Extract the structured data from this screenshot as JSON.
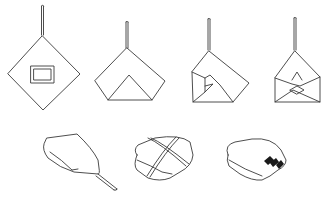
{
  "diagram": {
    "stroke_color": "#3a3a3a",
    "background": "#ffffff",
    "steps": [
      {
        "index": 1,
        "name": "object-centered-on-diamond-cloth"
      },
      {
        "index": 2,
        "name": "bottom-corner-folded-up"
      },
      {
        "index": 3,
        "name": "left-corner-folded-in"
      },
      {
        "index": 4,
        "name": "right-corner-folded-in"
      },
      {
        "index": 5,
        "name": "rolled-toward-top-corner"
      },
      {
        "index": 6,
        "name": "tied-with-string"
      },
      {
        "index": 7,
        "name": "finished-with-label-band"
      }
    ]
  }
}
